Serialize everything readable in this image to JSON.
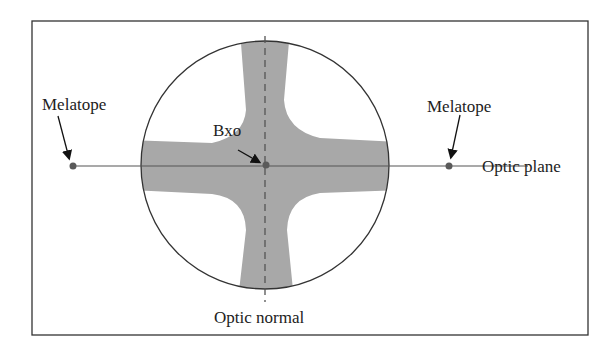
{
  "diagram": {
    "labels": {
      "melatope_left": "Melatope",
      "melatope_right": "Melatope",
      "bxo": "Bxo",
      "optic_plane": "Optic plane",
      "optic_normal": "Optic normal"
    },
    "colors": {
      "isogyre_fill": "#a8a8a8",
      "line": "#555555",
      "dot": "#5a5a5a",
      "frame": "#333333"
    }
  }
}
